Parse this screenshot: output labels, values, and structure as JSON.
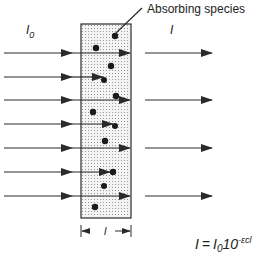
{
  "labels": {
    "absorbing_species": "Absorbing species",
    "incident_intensity": "I",
    "incident_sub": "0",
    "transmitted_intensity": "I",
    "path_length": "l"
  },
  "equation": {
    "lhs": "I",
    "equals": "=",
    "i0": "I",
    "i0_sub": "0",
    "base": "10",
    "exponent": "-εcl"
  },
  "colors": {
    "line": "#2a2a2a",
    "box_fill": "#f4f4f4",
    "dot_pattern": "#9a9a9a",
    "particle": "#1a1a1a"
  }
}
